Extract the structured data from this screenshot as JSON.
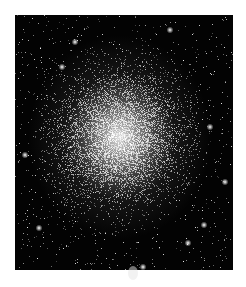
{
  "image": {
    "subject": "globular star cluster",
    "description": "Dense globular star cluster on black background, bright white core fading outward into scattered stars",
    "colors": {
      "background": "#ffffff",
      "sky": "#030303",
      "core": "#ebebeb"
    },
    "frame": {
      "x": 15,
      "y": 15,
      "width": 218,
      "height": 255
    },
    "core_center": {
      "x": 120,
      "y": 137
    }
  }
}
